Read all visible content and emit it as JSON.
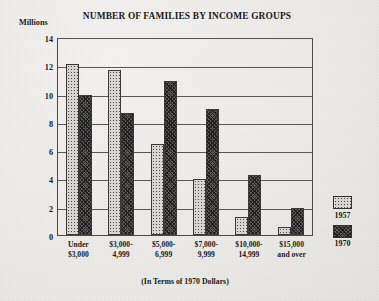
{
  "chart_data": {
    "type": "bar",
    "title": "NUMBER OF FAMILIES BY INCOME GROUPS",
    "subtitle": "(In Terms of 1970 Dollars)",
    "ylabel": "Millions",
    "xlabel": "",
    "ylim": [
      0,
      14
    ],
    "yticks": [
      "14",
      "12",
      "10",
      "8",
      "6",
      "4",
      "2",
      "0"
    ],
    "ytick_values": [
      14,
      12,
      10,
      8,
      6,
      4,
      2,
      0
    ],
    "grid": true,
    "legend_position": "right",
    "categories": [
      "Under\n$3,000",
      "$3,000-\n4,999",
      "$5,000-\n6,999",
      "$7,000-\n9,999",
      "$10,000-\n14,999",
      "$15,000\nand over"
    ],
    "category_lines": [
      [
        "Under",
        "$3,000"
      ],
      [
        "$3,000-",
        "4,999"
      ],
      [
        "$5,000-",
        "6,999"
      ],
      [
        "$7,000-",
        "9,999"
      ],
      [
        "$10,000-",
        "14,999"
      ],
      [
        "$15,000",
        "and over"
      ]
    ],
    "series": [
      {
        "name": "1957",
        "values": [
          12.2,
          11.8,
          6.5,
          4.0,
          1.3,
          0.6
        ]
      },
      {
        "name": "1970",
        "values": [
          10.0,
          8.7,
          11.0,
          9.0,
          4.3,
          1.9
        ]
      }
    ]
  },
  "legend": {
    "items": [
      {
        "label": "1957"
      },
      {
        "label": "1970"
      }
    ]
  }
}
